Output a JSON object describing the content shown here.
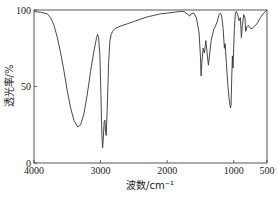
{
  "chart_data": {
    "type": "line",
    "title": "",
    "xlabel": "波数/cm⁻¹",
    "ylabel": "透光率/%",
    "xlim": [
      4000,
      500
    ],
    "ylim": [
      0,
      100
    ],
    "x_ticks": [
      4000,
      3000,
      2000,
      1000,
      500
    ],
    "y_ticks": [
      0,
      50,
      100
    ],
    "grid": false,
    "legend": null,
    "series": [
      {
        "name": "IR spectrum",
        "points": [
          [
            4000,
            99
          ],
          [
            3900,
            98.5
          ],
          [
            3800,
            97.5
          ],
          [
            3750,
            95
          ],
          [
            3700,
            90
          ],
          [
            3650,
            82
          ],
          [
            3600,
            72
          ],
          [
            3550,
            60
          ],
          [
            3500,
            47
          ],
          [
            3450,
            36
          ],
          [
            3400,
            28
          ],
          [
            3343,
            23.5
          ],
          [
            3300,
            25
          ],
          [
            3250,
            32
          ],
          [
            3200,
            45
          ],
          [
            3150,
            60
          ],
          [
            3100,
            73
          ],
          [
            3060,
            82
          ],
          [
            3045,
            84
          ],
          [
            3030,
            82
          ],
          [
            3010,
            70
          ],
          [
            2995,
            45
          ],
          [
            2980,
            18
          ],
          [
            2970,
            10
          ],
          [
            2960,
            15
          ],
          [
            2945,
            27
          ],
          [
            2935,
            28
          ],
          [
            2925,
            20
          ],
          [
            2915,
            18
          ],
          [
            2900,
            35
          ],
          [
            2880,
            65
          ],
          [
            2860,
            80
          ],
          [
            2840,
            84
          ],
          [
            2820,
            86
          ],
          [
            2780,
            88
          ],
          [
            2700,
            89.5
          ],
          [
            2600,
            91
          ],
          [
            2500,
            92.5
          ],
          [
            2400,
            94
          ],
          [
            2300,
            95.5
          ],
          [
            2200,
            96.5
          ],
          [
            2100,
            97.5
          ],
          [
            2000,
            98
          ],
          [
            1900,
            98.5
          ],
          [
            1800,
            99
          ],
          [
            1750,
            99
          ],
          [
            1700,
            97.5
          ],
          [
            1660,
            96
          ],
          [
            1640,
            97.5
          ],
          [
            1600,
            98
          ],
          [
            1560,
            95
          ],
          [
            1520,
            85
          ],
          [
            1500,
            70
          ],
          [
            1490,
            57
          ],
          [
            1480,
            65
          ],
          [
            1460,
            75
          ],
          [
            1440,
            72
          ],
          [
            1420,
            80
          ],
          [
            1400,
            72
          ],
          [
            1380,
            64
          ],
          [
            1370,
            68
          ],
          [
            1340,
            80
          ],
          [
            1300,
            87
          ],
          [
            1270,
            90
          ],
          [
            1250,
            92
          ],
          [
            1220,
            97
          ],
          [
            1200,
            98
          ],
          [
            1180,
            96
          ],
          [
            1160,
            88
          ],
          [
            1140,
            75
          ],
          [
            1130,
            78
          ],
          [
            1110,
            65
          ],
          [
            1090,
            52
          ],
          [
            1070,
            42
          ],
          [
            1050,
            36
          ],
          [
            1040,
            38
          ],
          [
            1030,
            55
          ],
          [
            1020,
            70
          ],
          [
            1010,
            62
          ],
          [
            1000,
            75
          ],
          [
            990,
            88
          ],
          [
            975,
            98
          ],
          [
            960,
            99
          ],
          [
            940,
            97
          ],
          [
            920,
            93
          ],
          [
            900,
            95
          ],
          [
            885,
            82
          ],
          [
            870,
            90
          ],
          [
            850,
            97
          ],
          [
            830,
            95
          ],
          [
            820,
            86
          ],
          [
            800,
            89
          ],
          [
            780,
            90
          ],
          [
            750,
            88
          ],
          [
            720,
            88
          ],
          [
            700,
            89
          ],
          [
            650,
            91
          ],
          [
            600,
            95
          ],
          [
            550,
            98
          ],
          [
            500,
            100
          ]
        ]
      }
    ],
    "annotations": []
  },
  "labels": {
    "xlabel": "波数/cm⁻¹",
    "ylabel": "透光率/%",
    "xticks": [
      "4000",
      "3000",
      "2000",
      "1000",
      "500"
    ],
    "yticks": [
      "0",
      "50",
      "100"
    ]
  }
}
